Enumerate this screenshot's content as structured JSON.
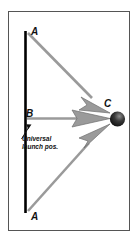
{
  "figure": {
    "background_color": "#ffffff",
    "frame_color": "#555555"
  },
  "labels": {
    "a_top": "A",
    "b": "B",
    "c": "C",
    "a_bottom": "A",
    "note_line1": "Universal",
    "note_line2": "launch pos."
  },
  "elements": {
    "launch_line_name": "vertical launch line",
    "launch_line_color": "#000000",
    "target_name": "target sphere",
    "target_color": "#1a1a1a",
    "arrow_color": "#9a9a9a",
    "arrow_outline_color": "#6e6e6e",
    "pointer_color": "#111111"
  },
  "arrows": [
    {
      "name": "arrow-a-top-to-c",
      "from": "A",
      "to": "C"
    },
    {
      "name": "arrow-b-to-c",
      "from": "B",
      "to": "C"
    },
    {
      "name": "arrow-a-bottom-to-c",
      "from": "A",
      "to": "C"
    }
  ]
}
